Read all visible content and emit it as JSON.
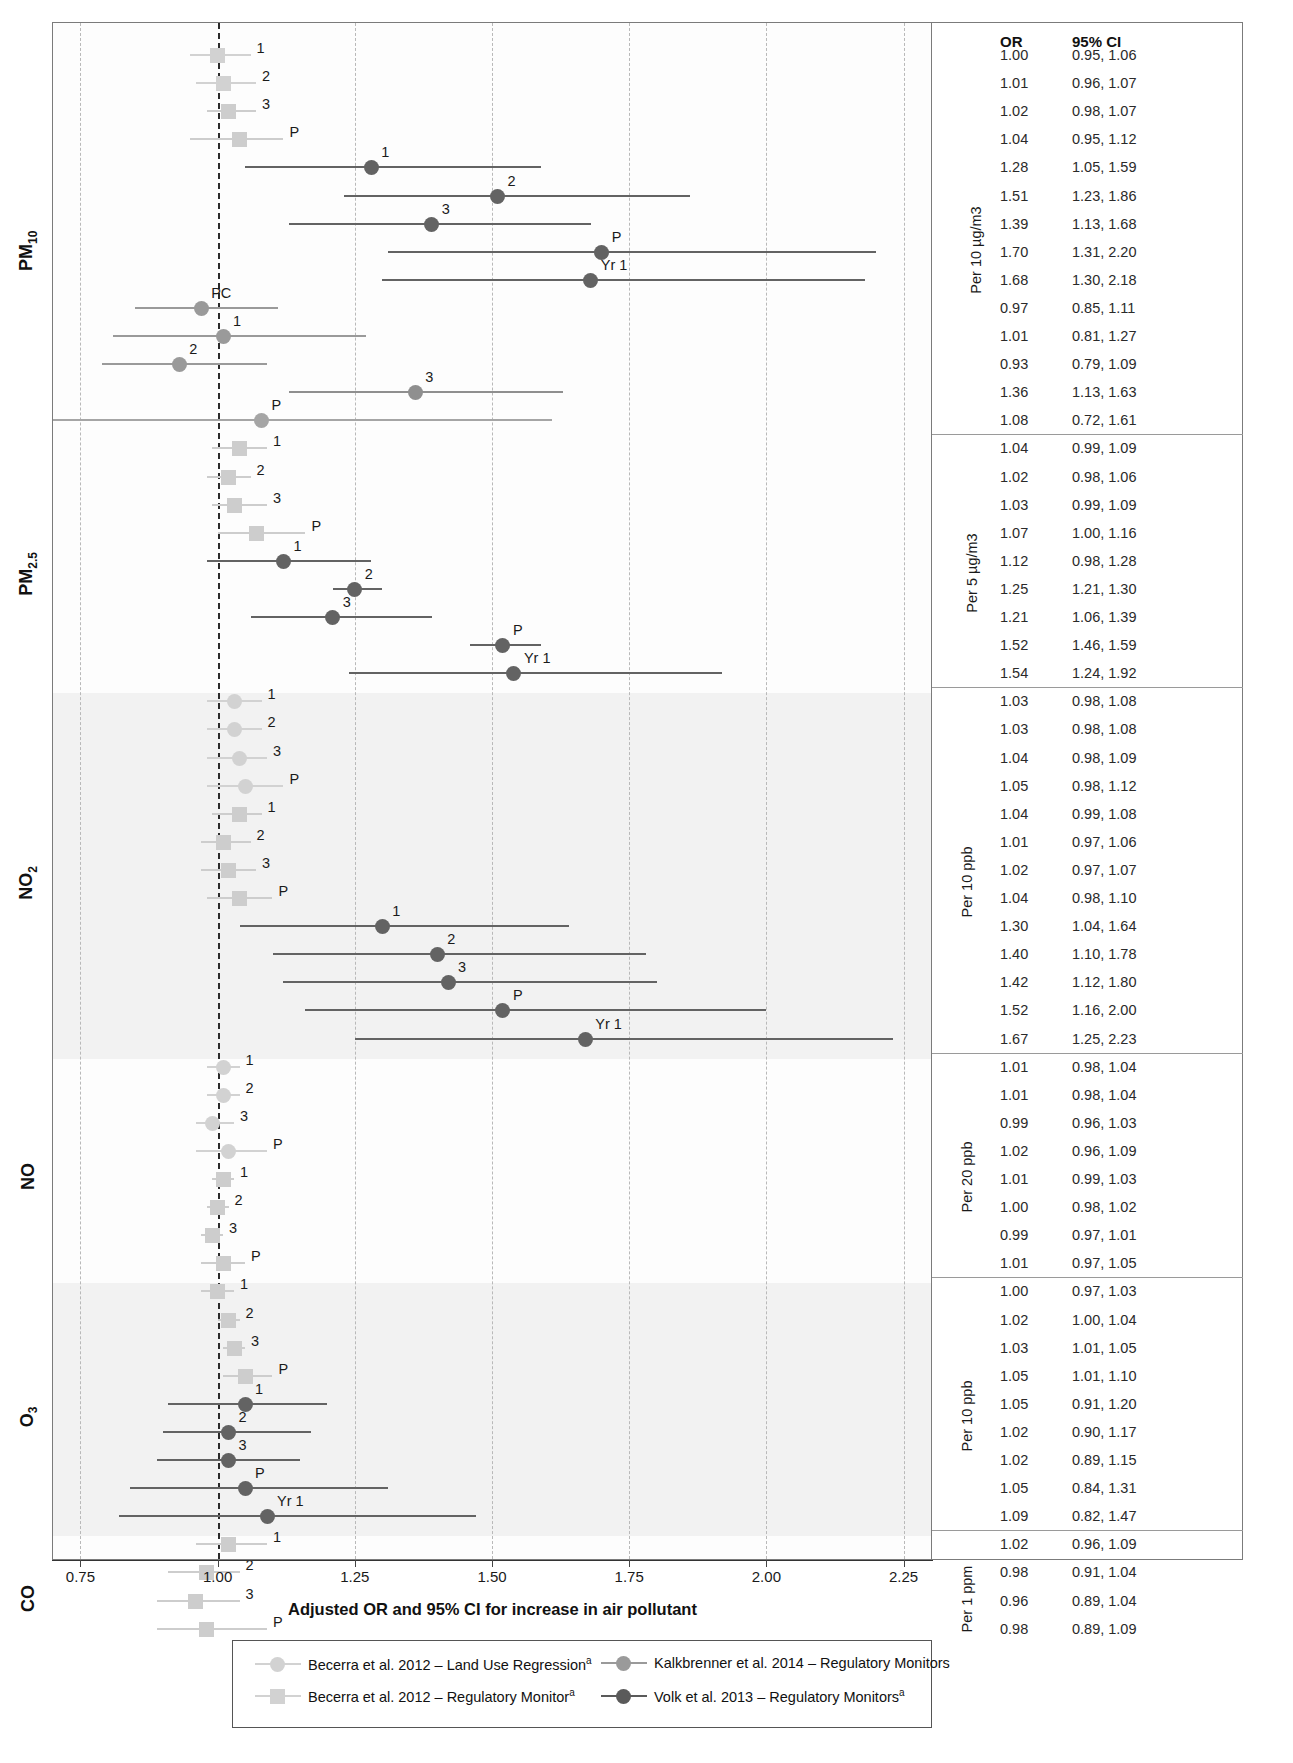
{
  "axis": {
    "title": "Adjusted OR and 95% CI for increase in air pollutant",
    "ticks": [
      "0.75",
      "1.00",
      "1.25",
      "1.50",
      "1.75",
      "2.00",
      "2.25"
    ],
    "tick_values": [
      0.75,
      1.0,
      1.25,
      1.5,
      1.75,
      2.0,
      2.25
    ],
    "xmin": 0.7,
    "xmax": 2.3,
    "reference_line": 1.0
  },
  "table_headers": {
    "or": "OR",
    "ci": "95% CI"
  },
  "legend": {
    "items": [
      {
        "label": "Becerra et al. 2012 – Land Use Regression",
        "sup": "a",
        "shape": "circle",
        "color": "#d2d2d2"
      },
      {
        "label": "Kalkbrenner et al. 2014 – Regulatory Monitors",
        "sup": "",
        "shape": "circle",
        "color": "#9a9a9a"
      },
      {
        "label": "Becerra et al. 2012 – Regulatory Monitor",
        "sup": "a",
        "shape": "square",
        "color": "#d2d2d2"
      },
      {
        "label": "Volk et al. 2013 – Regulatory Monitors",
        "sup": "a",
        "shape": "circle",
        "color": "#5a5a5a"
      }
    ]
  },
  "chart_data": {
    "type": "forest",
    "title": "",
    "xlabel": "Adjusted OR and 95% CI for increase in air pollutant",
    "ylabel": "",
    "xlim": [
      0.7,
      2.3
    ],
    "reference_line": 1.0,
    "grid": true,
    "legend_position": "bottom",
    "sections": [
      {
        "pollutant": "PM",
        "pollutant_sub": "10",
        "unit": "Per 10 µg/m3",
        "shaded": false,
        "rows": [
          {
            "label": "1",
            "or": "1.00",
            "ci": "0.95, 1.06",
            "est": 1.0,
            "lo": 0.95,
            "hi": 1.06,
            "series": "becerra-rm",
            "shape": "square",
            "color": "#d2d2d2"
          },
          {
            "label": "2",
            "or": "1.01",
            "ci": "0.96, 1.07",
            "est": 1.01,
            "lo": 0.96,
            "hi": 1.07,
            "series": "becerra-rm",
            "shape": "square",
            "color": "#d2d2d2"
          },
          {
            "label": "3",
            "or": "1.02",
            "ci": "0.98, 1.07",
            "est": 1.02,
            "lo": 0.98,
            "hi": 1.07,
            "series": "becerra-rm",
            "shape": "square",
            "color": "#cdcdcd"
          },
          {
            "label": "P",
            "or": "1.04",
            "ci": "0.95, 1.12",
            "est": 1.04,
            "lo": 0.95,
            "hi": 1.12,
            "series": "becerra-rm",
            "shape": "square",
            "color": "#cdcdcd"
          },
          {
            "label": "1",
            "or": "1.28",
            "ci": "1.05, 1.59",
            "est": 1.28,
            "lo": 1.05,
            "hi": 1.59,
            "series": "volk",
            "shape": "circle",
            "color": "#636363"
          },
          {
            "label": "2",
            "or": "1.51",
            "ci": "1.23, 1.86",
            "est": 1.51,
            "lo": 1.23,
            "hi": 1.86,
            "series": "volk",
            "shape": "circle",
            "color": "#636363"
          },
          {
            "label": "3",
            "or": "1.39",
            "ci": "1.13, 1.68",
            "est": 1.39,
            "lo": 1.13,
            "hi": 1.68,
            "series": "volk",
            "shape": "circle",
            "color": "#636363"
          },
          {
            "label": "P",
            "or": "1.70",
            "ci": "1.31, 2.20",
            "est": 1.7,
            "lo": 1.31,
            "hi": 2.2,
            "series": "volk",
            "shape": "circle",
            "color": "#636363"
          },
          {
            "label": "Yr 1",
            "or": "1.68",
            "ci": "1.30, 2.18",
            "est": 1.68,
            "lo": 1.3,
            "hi": 2.18,
            "series": "volk",
            "shape": "circle",
            "color": "#636363"
          },
          {
            "label": "PC",
            "or": "0.97",
            "ci": "0.85, 1.11",
            "est": 0.97,
            "lo": 0.85,
            "hi": 1.11,
            "series": "kalkbrenner",
            "shape": "circle",
            "color": "#9a9a9a"
          },
          {
            "label": "1",
            "or": "1.01",
            "ci": "0.81, 1.27",
            "est": 1.01,
            "lo": 0.81,
            "hi": 1.27,
            "series": "kalkbrenner",
            "shape": "circle",
            "color": "#9a9a9a"
          },
          {
            "label": "2",
            "or": "0.93",
            "ci": "0.79, 1.09",
            "est": 0.93,
            "lo": 0.79,
            "hi": 1.09,
            "series": "kalkbrenner",
            "shape": "circle",
            "color": "#9a9a9a"
          },
          {
            "label": "3",
            "or": "1.36",
            "ci": "1.13, 1.63",
            "est": 1.36,
            "lo": 1.13,
            "hi": 1.63,
            "series": "kalkbrenner",
            "shape": "circle",
            "color": "#8f8f8f"
          },
          {
            "label": "P",
            "or": "1.08",
            "ci": "0.72, 1.61",
            "est": 1.08,
            "lo": 0.7,
            "hi": 1.61,
            "series": "kalkbrenner",
            "shape": "circle",
            "color": "#a5a5a5"
          }
        ]
      },
      {
        "pollutant": "PM",
        "pollutant_sub": "2.5",
        "unit": "Per 5 µg/m3",
        "shaded": false,
        "rows": [
          {
            "label": "1",
            "or": "1.04",
            "ci": "0.99, 1.09",
            "est": 1.04,
            "lo": 0.99,
            "hi": 1.09,
            "series": "becerra-rm",
            "shape": "square",
            "color": "#cdcdcd"
          },
          {
            "label": "2",
            "or": "1.02",
            "ci": "0.98, 1.06",
            "est": 1.02,
            "lo": 0.98,
            "hi": 1.06,
            "series": "becerra-rm",
            "shape": "square",
            "color": "#cdcdcd"
          },
          {
            "label": "3",
            "or": "1.03",
            "ci": "0.99, 1.09",
            "est": 1.03,
            "lo": 0.99,
            "hi": 1.09,
            "series": "becerra-rm",
            "shape": "square",
            "color": "#cdcdcd"
          },
          {
            "label": "P",
            "or": "1.07",
            "ci": "1.00, 1.16",
            "est": 1.07,
            "lo": 1.0,
            "hi": 1.16,
            "series": "becerra-rm",
            "shape": "square",
            "color": "#cdcdcd"
          },
          {
            "label": "1",
            "or": "1.12",
            "ci": "0.98, 1.28",
            "est": 1.12,
            "lo": 0.98,
            "hi": 1.28,
            "series": "volk",
            "shape": "circle",
            "color": "#636363"
          },
          {
            "label": "2",
            "or": "1.25",
            "ci": "1.21, 1.30",
            "est": 1.25,
            "lo": 1.21,
            "hi": 1.3,
            "series": "volk",
            "shape": "circle",
            "color": "#636363"
          },
          {
            "label": "3",
            "or": "1.21",
            "ci": "1.06, 1.39",
            "est": 1.21,
            "lo": 1.06,
            "hi": 1.39,
            "series": "volk",
            "shape": "circle",
            "color": "#636363"
          },
          {
            "label": "P",
            "or": "1.52",
            "ci": "1.46, 1.59",
            "est": 1.52,
            "lo": 1.46,
            "hi": 1.59,
            "series": "volk",
            "shape": "circle",
            "color": "#636363"
          },
          {
            "label": "Yr 1",
            "or": "1.54",
            "ci": "1.24, 1.92",
            "est": 1.54,
            "lo": 1.24,
            "hi": 1.92,
            "series": "volk",
            "shape": "circle",
            "color": "#636363"
          }
        ]
      },
      {
        "pollutant": "NO",
        "pollutant_sub": "2",
        "unit": "Per 10 ppb",
        "shaded": true,
        "rows": [
          {
            "label": "1",
            "or": "1.03",
            "ci": "0.98, 1.08",
            "est": 1.03,
            "lo": 0.98,
            "hi": 1.08,
            "series": "becerra-lur",
            "shape": "circle",
            "color": "#d2d2d2"
          },
          {
            "label": "2",
            "or": "1.03",
            "ci": "0.98, 1.08",
            "est": 1.03,
            "lo": 0.98,
            "hi": 1.08,
            "series": "becerra-lur",
            "shape": "circle",
            "color": "#d2d2d2"
          },
          {
            "label": "3",
            "or": "1.04",
            "ci": "0.98, 1.09",
            "est": 1.04,
            "lo": 0.98,
            "hi": 1.09,
            "series": "becerra-lur",
            "shape": "circle",
            "color": "#d2d2d2"
          },
          {
            "label": "P",
            "or": "1.05",
            "ci": "0.98, 1.12",
            "est": 1.05,
            "lo": 0.98,
            "hi": 1.12,
            "series": "becerra-lur",
            "shape": "circle",
            "color": "#d2d2d2"
          },
          {
            "label": "1",
            "or": "1.04",
            "ci": "0.99, 1.08",
            "est": 1.04,
            "lo": 0.99,
            "hi": 1.08,
            "series": "becerra-rm",
            "shape": "square",
            "color": "#cdcdcd"
          },
          {
            "label": "2",
            "or": "1.01",
            "ci": "0.97, 1.06",
            "est": 1.01,
            "lo": 0.97,
            "hi": 1.06,
            "series": "becerra-rm",
            "shape": "square",
            "color": "#cdcdcd"
          },
          {
            "label": "3",
            "or": "1.02",
            "ci": "0.97, 1.07",
            "est": 1.02,
            "lo": 0.97,
            "hi": 1.07,
            "series": "becerra-rm",
            "shape": "square",
            "color": "#cdcdcd"
          },
          {
            "label": "P",
            "or": "1.04",
            "ci": "0.98, 1.10",
            "est": 1.04,
            "lo": 0.98,
            "hi": 1.1,
            "series": "becerra-rm",
            "shape": "square",
            "color": "#cdcdcd"
          },
          {
            "label": "1",
            "or": "1.30",
            "ci": "1.04, 1.64",
            "est": 1.3,
            "lo": 1.04,
            "hi": 1.64,
            "series": "volk",
            "shape": "circle",
            "color": "#636363"
          },
          {
            "label": "2",
            "or": "1.40",
            "ci": "1.10, 1.78",
            "est": 1.4,
            "lo": 1.1,
            "hi": 1.78,
            "series": "volk",
            "shape": "circle",
            "color": "#636363"
          },
          {
            "label": "3",
            "or": "1.42",
            "ci": "1.12, 1.80",
            "est": 1.42,
            "lo": 1.12,
            "hi": 1.8,
            "series": "volk",
            "shape": "circle",
            "color": "#636363"
          },
          {
            "label": "P",
            "or": "1.52",
            "ci": "1.16, 2.00",
            "est": 1.52,
            "lo": 1.16,
            "hi": 2.0,
            "series": "volk",
            "shape": "circle",
            "color": "#636363"
          },
          {
            "label": "Yr 1",
            "or": "1.67",
            "ci": "1.25, 2.23",
            "est": 1.67,
            "lo": 1.25,
            "hi": 2.23,
            "series": "volk",
            "shape": "circle",
            "color": "#636363"
          }
        ]
      },
      {
        "pollutant": "NO",
        "pollutant_sub": "",
        "unit": "Per 20 ppb",
        "shaded": false,
        "rows": [
          {
            "label": "1",
            "or": "1.01",
            "ci": "0.98, 1.04",
            "est": 1.01,
            "lo": 0.98,
            "hi": 1.04,
            "series": "becerra-lur",
            "shape": "circle",
            "color": "#d2d2d2"
          },
          {
            "label": "2",
            "or": "1.01",
            "ci": "0.98, 1.04",
            "est": 1.01,
            "lo": 0.98,
            "hi": 1.04,
            "series": "becerra-lur",
            "shape": "circle",
            "color": "#d2d2d2"
          },
          {
            "label": "3",
            "or": "0.99",
            "ci": "0.96, 1.03",
            "est": 0.99,
            "lo": 0.96,
            "hi": 1.03,
            "series": "becerra-lur",
            "shape": "circle",
            "color": "#d2d2d2"
          },
          {
            "label": "P",
            "or": "1.02",
            "ci": "0.96, 1.09",
            "est": 1.02,
            "lo": 0.96,
            "hi": 1.09,
            "series": "becerra-lur",
            "shape": "circle",
            "color": "#d2d2d2"
          },
          {
            "label": "1",
            "or": "1.01",
            "ci": "0.99, 1.03",
            "est": 1.01,
            "lo": 0.99,
            "hi": 1.03,
            "series": "becerra-rm",
            "shape": "square",
            "color": "#cdcdcd"
          },
          {
            "label": "2",
            "or": "1.00",
            "ci": "0.98, 1.02",
            "est": 1.0,
            "lo": 0.98,
            "hi": 1.02,
            "series": "becerra-rm",
            "shape": "square",
            "color": "#cdcdcd"
          },
          {
            "label": "3",
            "or": "0.99",
            "ci": "0.97, 1.01",
            "est": 0.99,
            "lo": 0.97,
            "hi": 1.01,
            "series": "becerra-rm",
            "shape": "square",
            "color": "#cdcdcd"
          },
          {
            "label": "P",
            "or": "1.01",
            "ci": "0.97, 1.05",
            "est": 1.01,
            "lo": 0.97,
            "hi": 1.05,
            "series": "becerra-rm",
            "shape": "square",
            "color": "#cdcdcd"
          }
        ]
      },
      {
        "pollutant": "O",
        "pollutant_sub": "3",
        "unit": "Per 10 ppb",
        "shaded": true,
        "rows": [
          {
            "label": "1",
            "or": "1.00",
            "ci": "0.97, 1.03",
            "est": 1.0,
            "lo": 0.97,
            "hi": 1.03,
            "series": "becerra-rm",
            "shape": "square",
            "color": "#cdcdcd"
          },
          {
            "label": "2",
            "or": "1.02",
            "ci": "1.00, 1.04",
            "est": 1.02,
            "lo": 1.0,
            "hi": 1.04,
            "series": "becerra-rm",
            "shape": "square",
            "color": "#cdcdcd"
          },
          {
            "label": "3",
            "or": "1.03",
            "ci": "1.01, 1.05",
            "est": 1.03,
            "lo": 1.01,
            "hi": 1.05,
            "series": "becerra-rm",
            "shape": "square",
            "color": "#cdcdcd"
          },
          {
            "label": "P",
            "or": "1.05",
            "ci": "1.01, 1.10",
            "est": 1.05,
            "lo": 1.01,
            "hi": 1.1,
            "series": "becerra-rm",
            "shape": "square",
            "color": "#cdcdcd"
          },
          {
            "label": "1",
            "or": "1.05",
            "ci": "0.91, 1.20",
            "est": 1.05,
            "lo": 0.91,
            "hi": 1.2,
            "series": "volk",
            "shape": "circle",
            "color": "#636363"
          },
          {
            "label": "2",
            "or": "1.02",
            "ci": "0.90, 1.17",
            "est": 1.02,
            "lo": 0.9,
            "hi": 1.17,
            "series": "volk",
            "shape": "circle",
            "color": "#636363"
          },
          {
            "label": "3",
            "or": "1.02",
            "ci": "0.89, 1.15",
            "est": 1.02,
            "lo": 0.89,
            "hi": 1.15,
            "series": "volk",
            "shape": "circle",
            "color": "#636363"
          },
          {
            "label": "P",
            "or": "1.05",
            "ci": "0.84, 1.31",
            "est": 1.05,
            "lo": 0.84,
            "hi": 1.31,
            "series": "volk",
            "shape": "circle",
            "color": "#636363"
          },
          {
            "label": "Yr 1",
            "or": "1.09",
            "ci": "0.82, 1.47",
            "est": 1.09,
            "lo": 0.82,
            "hi": 1.47,
            "series": "volk",
            "shape": "circle",
            "color": "#636363"
          }
        ]
      },
      {
        "pollutant": "CO",
        "pollutant_sub": "",
        "unit": "Per 1 ppm",
        "shaded": false,
        "rows": [
          {
            "label": "1",
            "or": "1.02",
            "ci": "0.96, 1.09",
            "est": 1.02,
            "lo": 0.96,
            "hi": 1.09,
            "series": "becerra-rm",
            "shape": "square",
            "color": "#cdcdcd"
          },
          {
            "label": "2",
            "or": "0.98",
            "ci": "0.91, 1.04",
            "est": 0.98,
            "lo": 0.91,
            "hi": 1.04,
            "series": "becerra-rm",
            "shape": "square",
            "color": "#cdcdcd"
          },
          {
            "label": "3",
            "or": "0.96",
            "ci": "0.89, 1.04",
            "est": 0.96,
            "lo": 0.89,
            "hi": 1.04,
            "series": "becerra-rm",
            "shape": "square",
            "color": "#cdcdcd"
          },
          {
            "label": "P",
            "or": "0.98",
            "ci": "0.89, 1.09",
            "est": 0.98,
            "lo": 0.89,
            "hi": 1.09,
            "series": "becerra-rm",
            "shape": "square",
            "color": "#cdcdcd"
          }
        ]
      }
    ]
  }
}
